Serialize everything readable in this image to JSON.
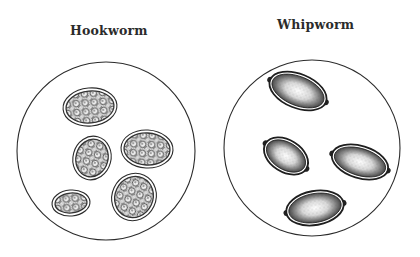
{
  "panels": [
    {
      "title": "Hookworm",
      "field": {
        "cx": 106,
        "cy": 151,
        "r": 89
      },
      "eggs": [
        {
          "cx": 90,
          "cy": 107,
          "rx": 27,
          "ry": 19,
          "rot": -5
        },
        {
          "cx": 92,
          "cy": 158,
          "rx": 19,
          "ry": 22,
          "rot": 15
        },
        {
          "cx": 147,
          "cy": 149,
          "rx": 26,
          "ry": 19,
          "rot": 3
        },
        {
          "cx": 71,
          "cy": 203,
          "rx": 19,
          "ry": 13,
          "rot": -5
        },
        {
          "cx": 134,
          "cy": 197,
          "rx": 22,
          "ry": 24,
          "rot": 25
        }
      ],
      "egg_style": "segmented-morula"
    },
    {
      "title": "Whipworm",
      "field": {
        "cx": 312,
        "cy": 148,
        "r": 88
      },
      "eggs": [
        {
          "cx": 298,
          "cy": 91,
          "rx": 30,
          "ry": 17,
          "rot": 22
        },
        {
          "cx": 286,
          "cy": 156,
          "rx": 24,
          "ry": 16,
          "rot": 32
        },
        {
          "cx": 360,
          "cy": 162,
          "rx": 29,
          "ry": 16,
          "rot": 17
        },
        {
          "cx": 315,
          "cy": 208,
          "rx": 29,
          "ry": 17,
          "rot": -10
        }
      ],
      "egg_style": "barrel-with-polar-plugs"
    }
  ],
  "colors": {
    "background": "#ffffff",
    "ink": "#2b2b2b",
    "stipple": "#3a3a3a",
    "egg_fill": "#f4f4f4"
  }
}
